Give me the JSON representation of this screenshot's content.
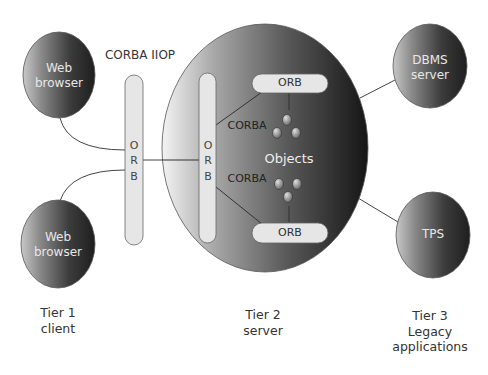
{
  "title_label": "CORBA IIOP",
  "tier1": {
    "browser_top": {
      "line1": "Web",
      "line2": "browser"
    },
    "browser_bottom": {
      "line1": "Web",
      "line2": "browser"
    },
    "label_line1": "Tier 1",
    "label_line2": "client"
  },
  "orb_bus_left": {
    "letters": [
      "O",
      "R",
      "B"
    ]
  },
  "tier2": {
    "orb_bus_inner": {
      "letters": [
        "O",
        "R",
        "B"
      ]
    },
    "orb_top": "ORB",
    "orb_bottom": "ORB",
    "corba_top": "CORBA",
    "corba_bottom": "CORBA",
    "objects": "Objects",
    "label_line1": "Tier 2",
    "label_line2": "server"
  },
  "tier3": {
    "dbms": {
      "line1": "DBMS",
      "line2": "server"
    },
    "tps": "TPS",
    "label_line1": "Tier 3",
    "label_line2": "Legacy",
    "label_line3": "applications"
  },
  "colors": {
    "node_dark": "#3a3a3a",
    "node_light": "#bdbdbd",
    "orb_fill": "#e6e6e6",
    "line": "#444444"
  }
}
